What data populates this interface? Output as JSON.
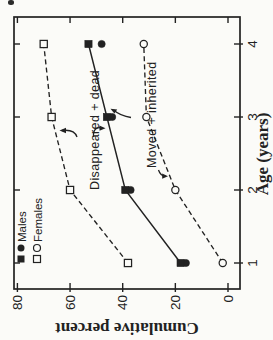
{
  "figure": {
    "axes": {
      "y_title": "Cumulative percent",
      "x_title": "Age (years)"
    },
    "legend": {
      "males": "Males",
      "females": "Females"
    },
    "annotations": {
      "disappeared_dead": "Disappeared + dead",
      "moved_inherited": "Moved + inherited"
    }
  },
  "chart_data": {
    "type": "line",
    "title": "",
    "xlabel": "Age (years)",
    "ylabel": "Cumulative percent",
    "x": [
      1,
      2,
      3,
      4
    ],
    "x_ticks": [
      "1",
      "2",
      "3",
      "4"
    ],
    "y_ticks": [
      "0",
      "20",
      "40",
      "60",
      "80"
    ],
    "xlim": [
      1,
      4
    ],
    "ylim": [
      0,
      80
    ],
    "grid": false,
    "legend_position": "upper-left",
    "series": [
      {
        "name": "Females disappeared + dead",
        "group": "Females",
        "marker": "square-open",
        "line": "dashed",
        "values": [
          38,
          60,
          67,
          70
        ]
      },
      {
        "name": "Females moved + inherited",
        "group": "Females",
        "marker": "circle-open",
        "line": "dashed",
        "values": [
          2,
          20,
          31,
          32
        ]
      },
      {
        "name": "Males moved + inherited",
        "group": "Males",
        "marker": "circle-filled",
        "line": "none",
        "values": [
          16,
          37,
          44,
          48
        ]
      },
      {
        "name": "Males disappeared + dead",
        "group": "Males",
        "marker": "square-filled",
        "line": "solid",
        "values": [
          18,
          39,
          46,
          53
        ]
      }
    ]
  },
  "colors": {
    "ink": "#222222",
    "paper": "#fbfbf8"
  }
}
